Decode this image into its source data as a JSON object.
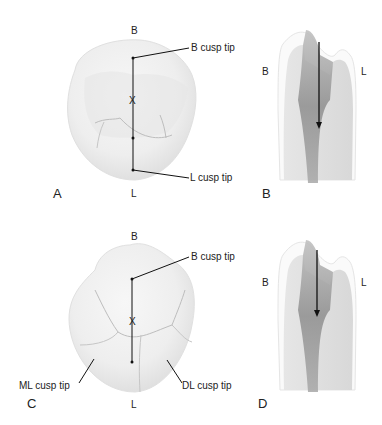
{
  "figure": {
    "panels": [
      {
        "id": "A",
        "label": "A",
        "view": "occlusal view, three-cusp tooth"
      },
      {
        "id": "B",
        "label": "B",
        "view": "cross-section with arrow"
      },
      {
        "id": "C",
        "label": "C",
        "view": "occlusal view, four-cusp tooth"
      },
      {
        "id": "D",
        "label": "D",
        "view": "cross-section with arrow"
      }
    ],
    "panel_a": {
      "top": "B",
      "bottom": "L",
      "center_mark": "X",
      "callouts": [
        "B cusp tip",
        "L cusp tip"
      ]
    },
    "panel_b": {
      "left": "B",
      "right": "L"
    },
    "panel_c": {
      "top": "B",
      "bottom": "L",
      "center_mark": "X",
      "callouts": [
        "B cusp tip",
        "ML cusp tip",
        "DL cusp tip"
      ]
    },
    "panel_d": {
      "left": "B",
      "right": "L"
    }
  },
  "colors": {
    "text": "#222222",
    "line": "#111111",
    "tooth_light": "#f4f4f4",
    "tooth_shadow": "#d9d9d9",
    "pulp": "#8a8a8a"
  }
}
